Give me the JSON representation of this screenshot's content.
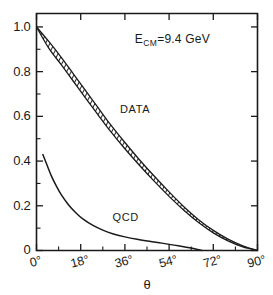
{
  "chart_data": {
    "type": "line",
    "title": "",
    "subtitle": "",
    "xlabel": "θ",
    "ylabel": "",
    "xlim": [
      0,
      90
    ],
    "ylim": [
      0,
      1.06
    ],
    "grid": false,
    "legend_position": "inline-annotation",
    "annotations": [
      {
        "text": "E",
        "sub": "CM",
        "rest": "=9.4 GeV",
        "x": 40,
        "y": 0.93
      }
    ],
    "x_ticks": [
      {
        "value": 0,
        "label": "0°"
      },
      {
        "value": 18,
        "label": "18°"
      },
      {
        "value": 36,
        "label": "36°"
      },
      {
        "value": 54,
        "label": "54°"
      },
      {
        "value": 72,
        "label": "72°"
      },
      {
        "value": 90,
        "label": "90°"
      }
    ],
    "x_minor_ticks": [
      9,
      27,
      45,
      63,
      81
    ],
    "y_ticks": [
      {
        "value": 1.0,
        "label": "1.0"
      },
      {
        "value": 0.8,
        "label": "0.8"
      },
      {
        "value": 0.6,
        "label": "0.6"
      },
      {
        "value": 0.4,
        "label": "0.4"
      },
      {
        "value": 0.2,
        "label": "0.2"
      },
      {
        "value": 0.0,
        "label": "0"
      }
    ],
    "y_minor_ticks": [
      0.1,
      0.3,
      0.5,
      0.7,
      0.9
    ],
    "series": [
      {
        "name": "DATA",
        "style": "hatched-band",
        "label": "DATA",
        "label_x": 34,
        "label_y": 0.63,
        "upper": [
          [
            0,
            1.0
          ],
          [
            5,
            0.935
          ],
          [
            10,
            0.865
          ],
          [
            15,
            0.79
          ],
          [
            20,
            0.715
          ],
          [
            25,
            0.64
          ],
          [
            30,
            0.565
          ],
          [
            36,
            0.483
          ],
          [
            42,
            0.405
          ],
          [
            48,
            0.332
          ],
          [
            54,
            0.262
          ],
          [
            60,
            0.196
          ],
          [
            66,
            0.138
          ],
          [
            72,
            0.09
          ],
          [
            78,
            0.051
          ],
          [
            84,
            0.021
          ],
          [
            90,
            0.0
          ]
        ],
        "lower": [
          [
            0,
            1.0
          ],
          [
            5,
            0.905
          ],
          [
            10,
            0.832
          ],
          [
            15,
            0.757
          ],
          [
            20,
            0.682
          ],
          [
            25,
            0.608
          ],
          [
            30,
            0.535
          ],
          [
            36,
            0.455
          ],
          [
            42,
            0.38
          ],
          [
            48,
            0.309
          ],
          [
            54,
            0.242
          ],
          [
            60,
            0.18
          ],
          [
            66,
            0.125
          ],
          [
            72,
            0.079
          ],
          [
            78,
            0.043
          ],
          [
            84,
            0.016
          ],
          [
            90,
            0.0
          ]
        ]
      },
      {
        "name": "QCD",
        "style": "line",
        "label": "QCD",
        "label_x": 31,
        "label_y": 0.145,
        "points": [
          [
            2.5,
            0.432
          ],
          [
            4,
            0.39
          ],
          [
            6,
            0.335
          ],
          [
            8,
            0.29
          ],
          [
            10,
            0.251
          ],
          [
            13,
            0.205
          ],
          [
            16,
            0.169
          ],
          [
            19,
            0.14
          ],
          [
            23,
            0.112
          ],
          [
            27,
            0.091
          ],
          [
            31,
            0.075
          ],
          [
            36,
            0.061
          ],
          [
            41,
            0.05
          ],
          [
            46,
            0.041
          ],
          [
            51,
            0.033
          ],
          [
            56,
            0.024
          ],
          [
            61,
            0.015
          ],
          [
            64,
            0.009
          ],
          [
            67.5,
            0.0
          ]
        ]
      }
    ]
  }
}
